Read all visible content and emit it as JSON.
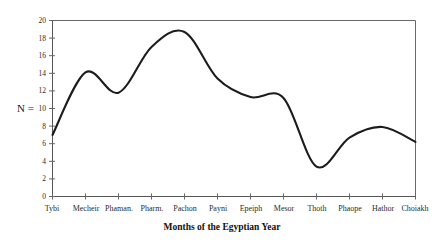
{
  "chart_data": {
    "type": "line",
    "title": "",
    "subtitle": "",
    "xlabel": "Months of the Egyptian Year",
    "ylabel": "N =",
    "categories": [
      "Tybi",
      "Mecheir",
      "Phaman.",
      "Pharm.",
      "Pachon",
      "Payni",
      "Epeiph",
      "Mesor",
      "Thoth",
      "Phaope",
      "Hathor",
      "Choiakh"
    ],
    "values": [
      7.0,
      14.1,
      11.8,
      17.0,
      18.7,
      13.4,
      11.3,
      11.2,
      3.4,
      6.7,
      7.9,
      6.2
    ],
    "x": [
      0,
      1,
      2,
      3,
      4,
      5,
      6,
      7,
      8,
      9,
      10,
      11
    ],
    "ylim": [
      0,
      20
    ],
    "xlim": [
      0,
      11
    ],
    "yticks": [
      0,
      2,
      4,
      6,
      8,
      10,
      12,
      14,
      16,
      18,
      20
    ],
    "ytick_labels": [
      "0",
      "2",
      "4",
      "6",
      "8",
      "10",
      "12",
      "14",
      "16",
      "18",
      "20"
    ],
    "grid": false,
    "legend": null,
    "legend_position": "none",
    "series": [
      {
        "name": "N",
        "values": [
          7.0,
          14.1,
          11.8,
          17.0,
          18.7,
          13.4,
          11.3,
          11.2,
          3.4,
          6.7,
          7.9,
          6.2
        ],
        "color": "#1c1c1c",
        "style": "smooth-spline"
      }
    ],
    "annotations": [
      {
        "label": "first local maximum",
        "x": 1,
        "y": 14.1
      },
      {
        "label": "local minimum",
        "x": 2,
        "y": 11.8
      },
      {
        "label": "global maximum",
        "x": 4,
        "y": 18.7
      },
      {
        "label": "global minimum",
        "x": 8,
        "y": 3.4
      },
      {
        "label": "secondary maximum",
        "x": 10,
        "y": 7.9
      }
    ]
  },
  "axes": {
    "y_axis_label": "N =",
    "x_axis_title": "Months of the Egyptian Year",
    "y_tick_labels": [
      "20",
      "18",
      "16",
      "14",
      "12",
      "10",
      "8",
      "6",
      "4",
      "2",
      "0"
    ],
    "x_tick_labels": [
      "Tybi",
      "Mecheir",
      "Phaman.",
      "Pharm.",
      "Pachon",
      "Payni",
      "Epeiph",
      "Mesor",
      "Thoth",
      "Phaope",
      "Hathor",
      "Choiakh"
    ]
  },
  "colors": {
    "curve": "#1c1c1c",
    "frame": "#6a6a6a",
    "axis": "#555555",
    "background": "#ffffff",
    "text": "#1a1a1a"
  }
}
